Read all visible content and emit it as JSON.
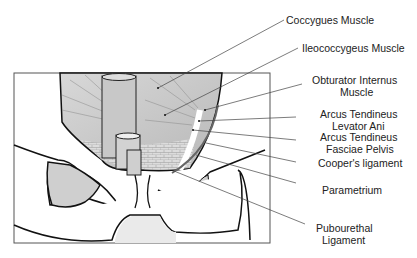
{
  "diagram": {
    "labels": [
      {
        "id": "coccygeus",
        "text": "Coccygues Muscle"
      },
      {
        "id": "ileococcygeus",
        "text": "Ileococcygeus Muscle"
      },
      {
        "id": "obturator1",
        "text": "Obturator Internus"
      },
      {
        "id": "obturator2",
        "text": "Muscle"
      },
      {
        "id": "atla1",
        "text": "Arcus Tendineus"
      },
      {
        "id": "atla2",
        "text": "Levator Ani"
      },
      {
        "id": "atfp1",
        "text": "Arcus Tendineus"
      },
      {
        "id": "atfp2",
        "text": "Fasciae Pelvis"
      },
      {
        "id": "cooper",
        "text": "Cooper's ligament"
      },
      {
        "id": "parametrium",
        "text": "Parametrium"
      },
      {
        "id": "pubo1",
        "text": "Pubourethal"
      },
      {
        "id": "pubo2",
        "text": "Ligament"
      }
    ]
  }
}
